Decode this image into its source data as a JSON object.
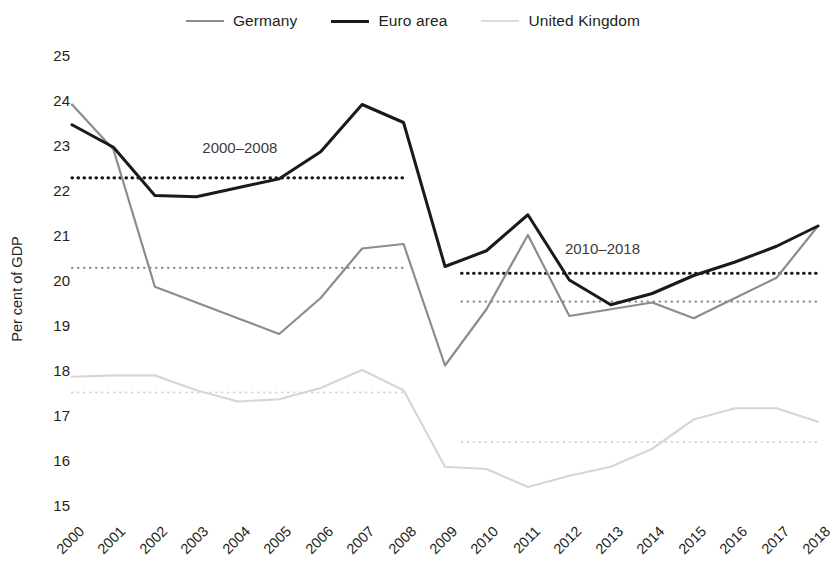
{
  "chart_data": {
    "type": "line",
    "title": "",
    "xlabel": "",
    "ylabel": "Per cent of GDP",
    "x": [
      2000,
      2001,
      2002,
      2003,
      2004,
      2005,
      2006,
      2007,
      2008,
      2009,
      2010,
      2011,
      2012,
      2013,
      2014,
      2015,
      2016,
      2017,
      2018
    ],
    "xtick_labels": [
      "2000",
      "2001",
      "2002",
      "2003",
      "2004",
      "2005",
      "2006",
      "2007",
      "2008",
      "2009",
      "2010",
      "2011",
      "2012",
      "2013",
      "2014",
      "2015",
      "2016",
      "2017",
      "2018"
    ],
    "ytick_labels": [
      "15",
      "16",
      "17",
      "18",
      "19",
      "20",
      "21",
      "22",
      "23",
      "24",
      "25"
    ],
    "ylim": [
      15,
      25
    ],
    "xlim": [
      2000,
      2018
    ],
    "grid": false,
    "legend_position": "top-center",
    "series": [
      {
        "name": "Germany",
        "color": "#8c8c8c",
        "width": 2.2,
        "values": [
          23.9,
          22.9,
          19.85,
          19.5,
          19.15,
          18.8,
          19.6,
          20.7,
          20.8,
          18.1,
          19.35,
          21.0,
          19.2,
          19.35,
          19.5,
          19.15,
          19.6,
          20.05,
          21.2
        ]
      },
      {
        "name": "Euro area",
        "color": "#1a1a1a",
        "width": 3.0,
        "values": [
          23.45,
          22.95,
          21.88,
          21.85,
          22.05,
          22.25,
          22.85,
          23.9,
          23.5,
          20.3,
          20.65,
          21.45,
          20.0,
          19.45,
          19.7,
          20.1,
          20.4,
          20.75,
          21.2
        ]
      },
      {
        "name": "United Kingdom",
        "color": "#d6d6d6",
        "width": 2.2,
        "values": [
          17.85,
          17.88,
          17.88,
          17.55,
          17.3,
          17.35,
          17.6,
          18.0,
          17.55,
          15.85,
          15.8,
          15.4,
          15.65,
          15.85,
          16.25,
          16.9,
          17.15,
          17.15,
          16.85
        ]
      }
    ],
    "reference_lines": [
      {
        "label": "Germany 2000-2018 avg (early)",
        "series": "Germany",
        "color": "#8c8c8c",
        "value": 20.27,
        "x_start": 2000,
        "x_end": 2008,
        "style": "dotted",
        "period": "2000-2008"
      },
      {
        "label": "Euro area 2000-2008 avg",
        "series": "Euro area",
        "color": "#1a1a1a",
        "value": 22.27,
        "x_start": 2000,
        "x_end": 2008,
        "style": "dotted",
        "period": "2000-2008"
      },
      {
        "label": "United Kingdom 2000-2008 avg",
        "series": "United Kingdom",
        "color": "#d6d6d6",
        "value": 17.5,
        "x_start": 2000,
        "x_end": 2008,
        "style": "dotted",
        "period": "2000-2008"
      },
      {
        "label": "Germany 2010-2018 avg",
        "series": "Germany",
        "color": "#8c8c8c",
        "value": 19.52,
        "x_start": 2009.4,
        "x_end": 2018,
        "style": "dotted",
        "period": "2010-2018"
      },
      {
        "label": "Euro area 2010-2018 avg",
        "series": "Euro area",
        "color": "#1a1a1a",
        "value": 20.15,
        "x_start": 2009.4,
        "x_end": 2018,
        "style": "dotted",
        "period": "2010-2018"
      },
      {
        "label": "United Kingdom 2010-2018 avg",
        "series": "United Kingdom",
        "color": "#d6d6d6",
        "value": 16.4,
        "x_start": 2009.4,
        "x_end": 2018,
        "style": "dotted",
        "period": "2010-2018"
      }
    ],
    "annotations": [
      {
        "text": "2000–2008",
        "x": 2004.05,
        "y": 22.95
      },
      {
        "text": "2010–2018",
        "x": 2012.8,
        "y": 20.72
      }
    ]
  },
  "legend": {
    "entries": [
      {
        "label": "Germany",
        "color": "#8c8c8c",
        "width": 2.2
      },
      {
        "label": "Euro area",
        "color": "#1a1a1a",
        "width": 3.2
      },
      {
        "label": "United Kingdom",
        "color": "#dcdcdc",
        "width": 2.0
      }
    ]
  }
}
